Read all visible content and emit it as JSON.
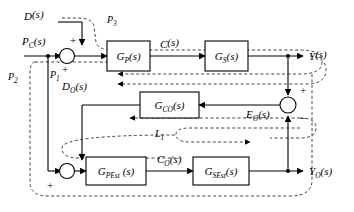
{
  "diagram": {
    "blocks": [
      {
        "id": "gp",
        "label": "G",
        "sub": "P",
        "tail": "(s)",
        "name": "block-gp"
      },
      {
        "id": "gs",
        "label": "G",
        "sub": "S",
        "tail": "(s)",
        "name": "block-gs"
      },
      {
        "id": "gco",
        "label": "G",
        "sub": "CO",
        "tail": "(s)",
        "name": "block-gco"
      },
      {
        "id": "gpest",
        "label": "G",
        "sub": "PEst",
        "tail": " (s)",
        "name": "block-gpest"
      },
      {
        "id": "gsest",
        "label": "G",
        "sub": "SEst",
        "tail": "(s)",
        "name": "block-gsest"
      }
    ],
    "signals": [
      {
        "id": "d",
        "label": "D",
        "sub": "",
        "tail": "(s)",
        "name": "signal-d"
      },
      {
        "id": "pc",
        "label": "P",
        "sub": "C",
        "tail": "(s)",
        "name": "signal-pc"
      },
      {
        "id": "c",
        "label": "C",
        "sub": "",
        "tail": "(s)",
        "name": "signal-c"
      },
      {
        "id": "y",
        "label": "Y",
        "sub": "",
        "tail": "(s)",
        "name": "signal-y"
      },
      {
        "id": "do",
        "label": "D",
        "sub": "O",
        "tail": "(s)",
        "name": "signal-do"
      },
      {
        "id": "eo",
        "label": "E",
        "sub": "O",
        "tail": "(s)",
        "name": "signal-eo"
      },
      {
        "id": "co",
        "label": "C",
        "sub": "O",
        "tail": "(s)",
        "name": "signal-co"
      },
      {
        "id": "yo",
        "label": "Y",
        "sub": "O",
        "tail": "(s)",
        "name": "signal-yo"
      }
    ],
    "regions": [
      {
        "id": "p1",
        "label": "P",
        "sub": "1",
        "name": "region-label-p1"
      },
      {
        "id": "p2",
        "label": "P",
        "sub": "2",
        "name": "region-label-p2"
      },
      {
        "id": "p3",
        "label": "P",
        "sub": "3",
        "name": "region-label-p3"
      },
      {
        "id": "l1",
        "label": "L",
        "sub": "1",
        "name": "region-label-l1"
      }
    ],
    "signs": {
      "sum_top_plus_upper": "+",
      "sum_top_plus_lower": "+",
      "sum_bot_plus_upper": "+",
      "sum_bot_plus_lower": "+",
      "sum_right_plus": "+",
      "sum_right_minus": "−"
    },
    "colors": {
      "stroke": "#000000",
      "dashed": "#444444",
      "background": "#ffffff"
    }
  }
}
